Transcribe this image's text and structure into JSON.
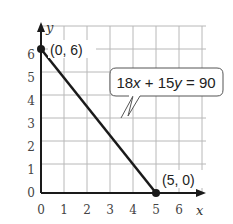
{
  "graph": {
    "equation": "18x + 15y = 90",
    "equation_parts": {
      "a": "18",
      "x": "x",
      "op": " + 15",
      "y": "y",
      "rhs": " = 90"
    },
    "x_axis_label": "x",
    "y_axis_label": "y",
    "x_ticks": [
      "0",
      "1",
      "2",
      "3",
      "4",
      "5",
      "6"
    ],
    "y_ticks": [
      "0",
      "1",
      "2",
      "3",
      "4",
      "5",
      "6"
    ],
    "points": [
      {
        "label": "(0, 6)",
        "x": 0,
        "y": 6
      },
      {
        "label": "(5, 0)",
        "x": 5,
        "y": 0
      }
    ],
    "colors": {
      "line": "#1a1a1a",
      "grid": "#b0b0b0",
      "text": "#333333"
    }
  }
}
